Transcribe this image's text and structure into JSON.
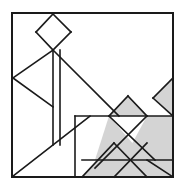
{
  "figure": {
    "width": 185,
    "height": 193,
    "background_color": "#ffffff",
    "stroke_color": "#1a1a1a",
    "fill_light": "#ffffff",
    "fill_shaded": "#d4d4d4",
    "stroke_width": 1.6,
    "frame_stroke_width": 2.0
  },
  "frame": {
    "label": "outer-square",
    "x": 12,
    "y": 13,
    "width": 161,
    "height": 164,
    "fill": "#ffffff"
  },
  "shapes": [
    {
      "id": "diamond-top",
      "label": "Top diamond (square rotated 45 degrees)",
      "fill": "light",
      "points": "53,14 71,32 53,50 36,32"
    },
    {
      "id": "triangle-left-upper",
      "label": "Left upper triangle",
      "fill": "light",
      "points": "53,50 53,107 13,78"
    },
    {
      "id": "triangle-left-wedge",
      "label": "Left wedge triangle above vertex",
      "fill": "light",
      "points": "13,78 53,50 13,50"
    },
    {
      "id": "triangle-large-diagonal",
      "label": "Large diagonal triangle from diamond to center",
      "fill": "light",
      "points": "53,50 97,95 53,95"
    },
    {
      "id": "triangle-mid-slope",
      "label": "Mid slope triangle toward center square",
      "fill": "light",
      "points": "97,95 75,116 53,95"
    },
    {
      "id": "triangle-bottom-left-big",
      "label": "Big bottom-left triangle",
      "fill": "light",
      "points": "12,177 53,145 53,177"
    },
    {
      "id": "strip-left-vertical",
      "label": "Left vertical strip band",
      "fill": "light",
      "points": "53,50 60,50 60,145 53,145"
    },
    {
      "id": "square-center",
      "label": "Center lower square",
      "fill": "light",
      "points": "75,116 114,116 114,177 75,177"
    },
    {
      "id": "triangle-gray-upper-mid",
      "label": "Shaded triangle above center-right",
      "fill": "shaded",
      "points": "128,96 147,116 109,116"
    },
    {
      "id": "triangle-gray-right-arrow",
      "label": "Shaded right-pointing wedge at right edge",
      "fill": "shaded",
      "points": "153,98 173,78 173,116"
    },
    {
      "id": "triangle-gray-right-block",
      "label": "Large shaded triangle bottom-right",
      "fill": "shaded",
      "points": "147,116 173,116 173,177 114,177"
    },
    {
      "id": "triangle-gray-center-big",
      "label": "Large shaded triangle center bottom",
      "fill": "shaded",
      "points": "109,116 147,160 95,160"
    },
    {
      "id": "triangle-gray-bottom-apex",
      "label": "Shaded triangle with apex at bottom center",
      "fill": "shaded",
      "points": "114,143 147,177 82,177"
    },
    {
      "id": "triangle-gray-bottom-right-small",
      "label": "Small shaded triangle bottom right corner",
      "fill": "shaded",
      "points": "147,160 173,160 173,177"
    }
  ],
  "lines": [
    {
      "id": "line-diamond-nw",
      "x1": 53,
      "y1": 14,
      "x2": 36,
      "y2": 32
    },
    {
      "id": "line-diamond-ne",
      "x1": 53,
      "y1": 14,
      "x2": 71,
      "y2": 32
    },
    {
      "id": "line-diamond-sw",
      "x1": 36,
      "y1": 32,
      "x2": 53,
      "y2": 50
    },
    {
      "id": "line-diamond-se",
      "x1": 71,
      "y1": 32,
      "x2": 53,
      "y2": 50
    },
    {
      "id": "line-left-up",
      "x1": 53,
      "y1": 50,
      "x2": 13,
      "y2": 78
    },
    {
      "id": "line-left-down",
      "x1": 13,
      "y1": 78,
      "x2": 53,
      "y2": 107
    },
    {
      "id": "line-vert-inner-a",
      "x1": 53,
      "y1": 50,
      "x2": 53,
      "y2": 145
    },
    {
      "id": "line-vert-inner-b",
      "x1": 60,
      "y1": 50,
      "x2": 60,
      "y2": 145
    },
    {
      "id": "line-big-diag",
      "x1": 53,
      "y1": 50,
      "x2": 119,
      "y2": 116
    },
    {
      "id": "line-bottom-left-diag",
      "x1": 12,
      "y1": 177,
      "x2": 90,
      "y2": 116
    },
    {
      "id": "line-center-horiz",
      "x1": 75,
      "y1": 116,
      "x2": 173,
      "y2": 116
    },
    {
      "id": "line-center-vert",
      "x1": 75,
      "y1": 116,
      "x2": 75,
      "y2": 177
    },
    {
      "id": "line-gray-apex-left",
      "x1": 128,
      "y1": 96,
      "x2": 109,
      "y2": 116
    },
    {
      "id": "line-gray-apex-right",
      "x1": 128,
      "y1": 96,
      "x2": 147,
      "y2": 116
    },
    {
      "id": "line-right-wedge-up",
      "x1": 153,
      "y1": 98,
      "x2": 173,
      "y2": 78
    },
    {
      "id": "line-right-wedge-down",
      "x1": 153,
      "y1": 98,
      "x2": 173,
      "y2": 116
    },
    {
      "id": "line-center-cross-down",
      "x1": 109,
      "y1": 116,
      "x2": 155,
      "y2": 160
    },
    {
      "id": "line-center-cross-up",
      "x1": 147,
      "y1": 116,
      "x2": 95,
      "y2": 168
    },
    {
      "id": "line-bottom-horiz",
      "x1": 82,
      "y1": 160,
      "x2": 173,
      "y2": 160
    },
    {
      "id": "line-bottom-apex-left",
      "x1": 114,
      "y1": 143,
      "x2": 82,
      "y2": 177
    },
    {
      "id": "line-bottom-apex-right",
      "x1": 114,
      "y1": 143,
      "x2": 147,
      "y2": 177
    },
    {
      "id": "line-right-corner-diag",
      "x1": 147,
      "y1": 160,
      "x2": 173,
      "y2": 177
    },
    {
      "id": "line-bottom-right-diag",
      "x1": 114,
      "y1": 177,
      "x2": 147,
      "y2": 143
    }
  ]
}
